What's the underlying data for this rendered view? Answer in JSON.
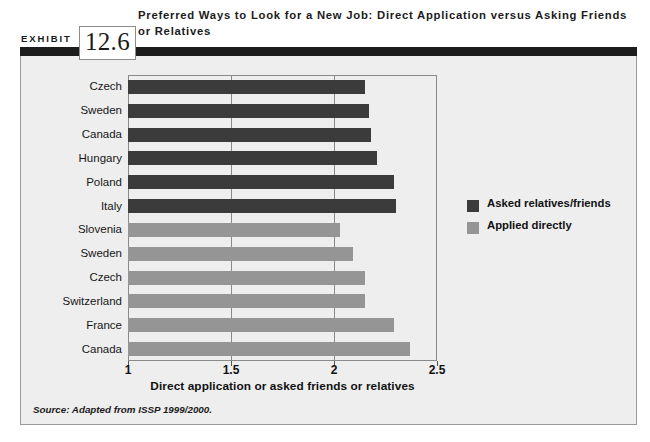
{
  "exhibit": {
    "label": "EXHIBIT",
    "number": "12.6",
    "title": "Preferred Ways to Look for a New Job: Direct Application versus Asking Friends or Relatives"
  },
  "source": {
    "note": "Source: Adapted from ISSP 1999/2000."
  },
  "colors": {
    "dark_series": "#3b3b3b",
    "light_series": "#959595",
    "panel_background": "#eeeeee",
    "frame_border": "#9a9a9a",
    "plot_border": "#8a8a8a",
    "header_rule": "#1c1c1c"
  },
  "chart_data": {
    "type": "bar",
    "orientation": "horizontal",
    "title": "Preferred Ways to Look for a New Job: Direct Application versus Asking Friends or Relatives",
    "xlabel": "Direct application or asked friends or relatives",
    "ylabel": "",
    "xlim": [
      1,
      2.5
    ],
    "xticks": [
      1,
      1.5,
      2,
      2.5
    ],
    "xticklabels": [
      "1",
      "1.5",
      "2",
      "2.5"
    ],
    "grid": "vertical",
    "legend_position": "right",
    "categories": [
      "Czech",
      "Sweden",
      "Canada",
      "Hungary",
      "Poland",
      "Italy",
      "Slovenia",
      "Sweden",
      "Czech",
      "Switzerland",
      "France",
      "Canada"
    ],
    "series": [
      {
        "name": "Asked relatives/friends",
        "color": "#3b3b3b",
        "values": [
          2.15,
          2.17,
          2.18,
          2.21,
          2.29,
          2.3,
          null,
          null,
          null,
          null,
          null,
          null
        ]
      },
      {
        "name": "Applied directly",
        "color": "#959595",
        "values": [
          null,
          null,
          null,
          null,
          null,
          null,
          2.03,
          2.09,
          2.15,
          2.15,
          2.29,
          2.37
        ]
      }
    ],
    "bars": [
      {
        "category": "Czech",
        "value": 2.15,
        "series": "Asked relatives/friends"
      },
      {
        "category": "Sweden",
        "value": 2.17,
        "series": "Asked relatives/friends"
      },
      {
        "category": "Canada",
        "value": 2.18,
        "series": "Asked relatives/friends"
      },
      {
        "category": "Hungary",
        "value": 2.21,
        "series": "Asked relatives/friends"
      },
      {
        "category": "Poland",
        "value": 2.29,
        "series": "Asked relatives/friends"
      },
      {
        "category": "Italy",
        "value": 2.3,
        "series": "Asked relatives/friends"
      },
      {
        "category": "Slovenia",
        "value": 2.03,
        "series": "Applied directly"
      },
      {
        "category": "Sweden",
        "value": 2.09,
        "series": "Applied directly"
      },
      {
        "category": "Czech",
        "value": 2.15,
        "series": "Applied directly"
      },
      {
        "category": "Switzerland",
        "value": 2.15,
        "series": "Applied directly"
      },
      {
        "category": "France",
        "value": 2.29,
        "series": "Applied directly"
      },
      {
        "category": "Canada",
        "value": 2.37,
        "series": "Applied directly"
      }
    ],
    "legend": [
      {
        "label": "Asked relatives/friends",
        "color": "#3b3b3b"
      },
      {
        "label": "Applied directly",
        "color": "#959595"
      }
    ]
  }
}
